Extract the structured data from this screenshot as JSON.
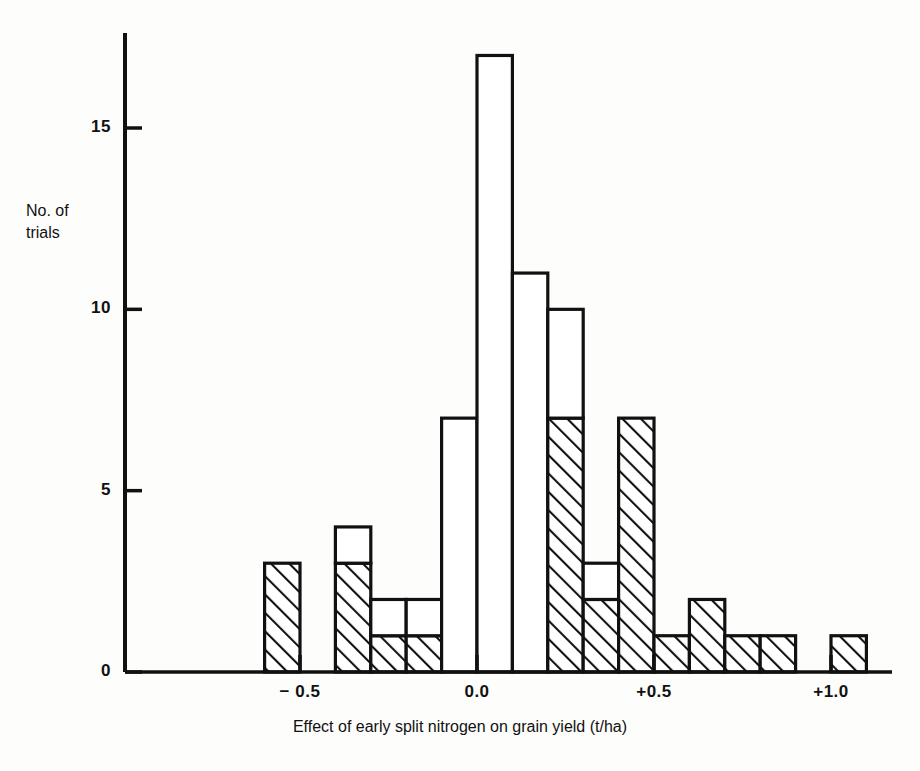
{
  "axes": {
    "y_title": "No. of\ntrials",
    "x_title": "Effect of early split nitrogen on grain yield (t/ha)",
    "y_ticks": [
      "0",
      "5",
      "10",
      "15"
    ],
    "x_ticks": [
      "− 0.5",
      "0.0",
      "+0.5",
      "+1.0"
    ]
  },
  "style": {
    "axis_color": "#111111",
    "bar_outline": "#111111",
    "bar_fill_open": "#ffffff",
    "hatch_color": "#111111"
  },
  "chart_data": {
    "type": "bar",
    "title": "",
    "subtitle": "",
    "xlabel": "Effect of early split nitrogen on grain yield (t/ha)",
    "ylabel": "No. of trials",
    "xlim": [
      -0.6,
      1.15
    ],
    "ylim": [
      0,
      17.5
    ],
    "grid": false,
    "legend": "none",
    "bin_width": 0.1,
    "x_tick_values": [
      -0.5,
      0.0,
      0.5,
      1.0
    ],
    "x_tick_labels": [
      "− 0.5",
      "0.0",
      "+0.5",
      "+1.0"
    ],
    "y_tick_values": [
      0,
      5,
      10,
      15
    ],
    "y_tick_labels": [
      "0",
      "5",
      "10",
      "15"
    ],
    "note": "Stacked histogram: each bin has a hatched (lower) segment and an open/white (upper) segment; total = hatched + open.",
    "categories": [
      "-0.6",
      "-0.5",
      "-0.4",
      "-0.3",
      "-0.2",
      "-0.1",
      "0.0",
      "0.1",
      "0.2",
      "0.3",
      "0.4",
      "0.5",
      "0.6",
      "0.7",
      "0.8",
      "0.9",
      "1.0"
    ],
    "bins": [
      {
        "x0": -0.6,
        "x1": -0.5,
        "total": 3,
        "hatched": 3,
        "open": 0
      },
      {
        "x0": -0.5,
        "x1": -0.4,
        "total": 0,
        "hatched": 0,
        "open": 0
      },
      {
        "x0": -0.4,
        "x1": -0.3,
        "total": 4,
        "hatched": 3,
        "open": 1
      },
      {
        "x0": -0.3,
        "x1": -0.2,
        "total": 2,
        "hatched": 1,
        "open": 1
      },
      {
        "x0": -0.2,
        "x1": -0.1,
        "total": 2,
        "hatched": 1,
        "open": 1
      },
      {
        "x0": -0.1,
        "x1": 0.0,
        "total": 7,
        "hatched": 0,
        "open": 7
      },
      {
        "x0": 0.0,
        "x1": 0.1,
        "total": 17,
        "hatched": 0,
        "open": 17
      },
      {
        "x0": 0.1,
        "x1": 0.2,
        "total": 11,
        "hatched": 0,
        "open": 11
      },
      {
        "x0": 0.2,
        "x1": 0.3,
        "total": 10,
        "hatched": 7,
        "open": 3
      },
      {
        "x0": 0.3,
        "x1": 0.4,
        "total": 3,
        "hatched": 2,
        "open": 1
      },
      {
        "x0": 0.4,
        "x1": 0.5,
        "total": 7,
        "hatched": 7,
        "open": 0
      },
      {
        "x0": 0.5,
        "x1": 0.6,
        "total": 1,
        "hatched": 1,
        "open": 0
      },
      {
        "x0": 0.6,
        "x1": 0.7,
        "total": 2,
        "hatched": 2,
        "open": 0
      },
      {
        "x0": 0.7,
        "x1": 0.8,
        "total": 1,
        "hatched": 1,
        "open": 0
      },
      {
        "x0": 0.8,
        "x1": 0.9,
        "total": 1,
        "hatched": 1,
        "open": 0
      },
      {
        "x0": 0.9,
        "x1": 1.0,
        "total": 0,
        "hatched": 0,
        "open": 0
      },
      {
        "x0": 1.0,
        "x1": 1.1,
        "total": 1,
        "hatched": 1,
        "open": 0
      }
    ],
    "values": [
      3,
      0,
      4,
      2,
      2,
      7,
      17,
      11,
      10,
      3,
      7,
      1,
      2,
      1,
      1,
      0,
      1
    ],
    "series": [
      {
        "name": "hatched",
        "values": [
          3,
          0,
          3,
          1,
          1,
          0,
          0,
          0,
          7,
          2,
          7,
          1,
          2,
          1,
          1,
          0,
          1
        ]
      },
      {
        "name": "open",
        "values": [
          0,
          0,
          1,
          1,
          1,
          7,
          17,
          11,
          3,
          1,
          0,
          0,
          0,
          0,
          0,
          0,
          0
        ]
      }
    ]
  }
}
